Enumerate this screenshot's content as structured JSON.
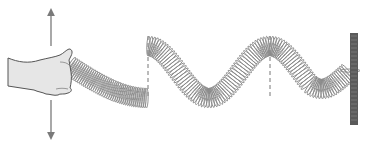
{
  "diagram": {
    "elements": [
      "hand",
      "up-arrow",
      "down-arrow",
      "spring-wave",
      "dashed-lines",
      "fixed-wall"
    ],
    "colors": {
      "background": "#ffffff",
      "hand_fill": "#e6e6e6",
      "outline": "#555555",
      "coil": "#8a8a8a",
      "arrow": "#7a7a7a",
      "dashed": "#777777",
      "wall": "#5a5a5a"
    },
    "dashed_lines_x": [
      148,
      270
    ],
    "wall": {
      "x": 350,
      "y": 33,
      "width": 8,
      "height": 92
    }
  }
}
